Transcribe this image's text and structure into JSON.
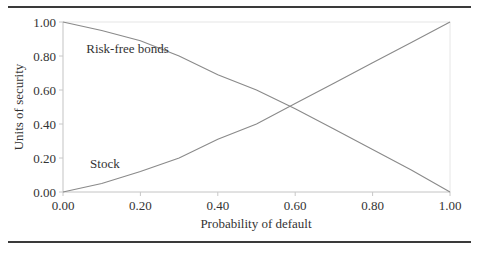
{
  "chart_data": {
    "type": "line",
    "title": "",
    "xlabel": "Probability of default",
    "ylabel": "Units of security",
    "xlim": [
      0,
      1
    ],
    "ylim": [
      0,
      1
    ],
    "x_ticks": [
      "0.00",
      "0.20",
      "0.40",
      "0.60",
      "0.80",
      "1.00"
    ],
    "y_ticks": [
      "0.00",
      "0.20",
      "0.40",
      "0.60",
      "0.80",
      "1.00"
    ],
    "grid": false,
    "legend": "inline labels",
    "x": [
      0.0,
      0.1,
      0.2,
      0.3,
      0.4,
      0.5,
      0.6,
      0.7,
      0.8,
      0.9,
      1.0
    ],
    "series": [
      {
        "name": "Risk-free bonds",
        "values": [
          1.0,
          0.95,
          0.89,
          0.8,
          0.69,
          0.6,
          0.49,
          0.37,
          0.25,
          0.13,
          0.0
        ]
      },
      {
        "name": "Stock",
        "values": [
          0.0,
          0.05,
          0.12,
          0.2,
          0.31,
          0.4,
          0.52,
          0.64,
          0.76,
          0.88,
          1.0
        ]
      }
    ],
    "annotations": [
      {
        "text": "Risk-free bonds",
        "x": 0.06,
        "y": 0.82
      },
      {
        "text": "Stock",
        "x": 0.07,
        "y": 0.14
      }
    ]
  }
}
